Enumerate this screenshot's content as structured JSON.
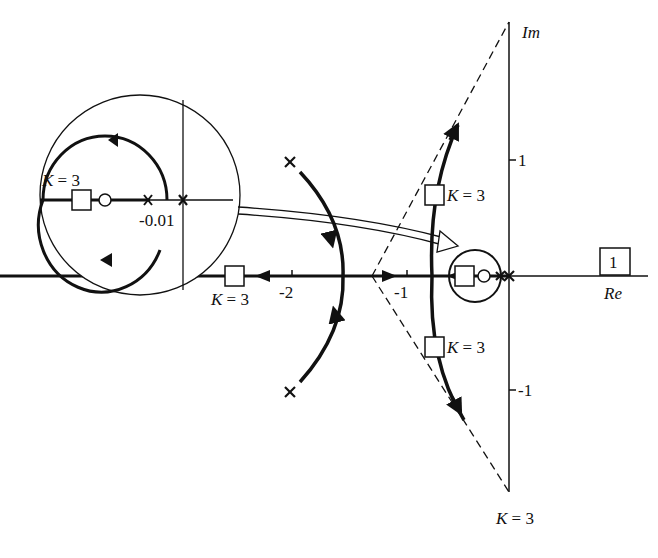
{
  "diagram": {
    "type": "root-locus",
    "axes": {
      "real_label": "Re",
      "imag_label": "Im",
      "real_ticks": [
        "-2",
        "-1"
      ],
      "imag_ticks": [
        "1",
        "-1"
      ],
      "boxed_tick": "1"
    },
    "gain_labels": {
      "upper_branch": "K = 3",
      "lower_branch": "K = 3",
      "real_axis_left": "K = 3",
      "bottom": "K = 3",
      "inset": "K = 3"
    },
    "inset": {
      "label": "-0.01",
      "description": "magnified view near origin"
    },
    "colors": {
      "ink": "#111111",
      "background": "#ffffff"
    }
  }
}
